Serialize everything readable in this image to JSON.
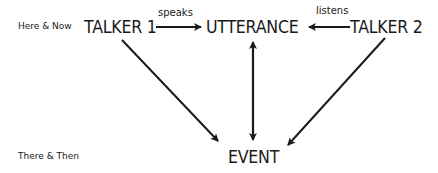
{
  "diagram": {
    "rows": {
      "top": "Here & Now",
      "bottom": "There & Then"
    },
    "nodes": {
      "talker1": "TALKER 1",
      "utterance": "UTTERANCE",
      "talker2": "TALKER 2",
      "event": "EVENT"
    },
    "edges": {
      "speaks": "speaks",
      "listens": "listens"
    },
    "edge_list": [
      {
        "from": "TALKER 1",
        "to": "UTTERANCE",
        "label": "speaks",
        "direction": "forward"
      },
      {
        "from": "TALKER 2",
        "to": "UTTERANCE",
        "label": "listens",
        "direction": "forward"
      },
      {
        "from": "TALKER 1",
        "to": "EVENT",
        "label": "",
        "direction": "forward"
      },
      {
        "from": "TALKER 2",
        "to": "EVENT",
        "label": "",
        "direction": "forward"
      },
      {
        "from": "UTTERANCE",
        "to": "EVENT",
        "label": "",
        "direction": "both"
      }
    ],
    "colors": {
      "ink": "#1a1a1a",
      "background": "#ffffff"
    }
  }
}
